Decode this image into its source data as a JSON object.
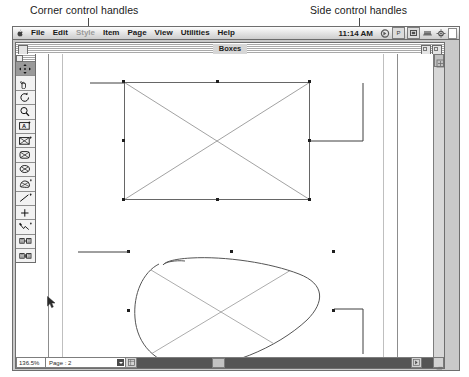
{
  "annotations": [
    {
      "id": "corner",
      "label": "Corner control handles"
    },
    {
      "id": "side",
      "label": "Side control handles"
    }
  ],
  "menubar": {
    "apple_icon": "apple-icon",
    "items": [
      {
        "label": "File",
        "enabled": true
      },
      {
        "label": "Edit",
        "enabled": true
      },
      {
        "label": "Style",
        "enabled": false
      },
      {
        "label": "Item",
        "enabled": true
      },
      {
        "label": "Page",
        "enabled": true
      },
      {
        "label": "View",
        "enabled": true
      },
      {
        "label": "Utilities",
        "enabled": true
      },
      {
        "label": "Help",
        "enabled": true
      }
    ],
    "clock": "11:14 AM",
    "status_icons": [
      {
        "name": "speaker-icon",
        "glyph": "◑"
      },
      {
        "name": "print-monitor-icon",
        "glyph": "P"
      },
      {
        "name": "network-icon",
        "glyph": "▣"
      },
      {
        "name": "filesharing-icon",
        "glyph": "▰"
      },
      {
        "name": "application-switcher-icon",
        "glyph": "✾"
      }
    ]
  },
  "window": {
    "title": "Boxes",
    "close_box": "close-box",
    "zoom_box": "zoom-box",
    "collapse_box": "collapse-box"
  },
  "tool_palette": {
    "title": "tool-palette-title",
    "tools": [
      {
        "name": "item-tool",
        "label": "Item tool",
        "active": true
      },
      {
        "name": "content-tool",
        "label": "Content tool",
        "active": false
      },
      {
        "name": "rotation-tool",
        "label": "Rotation tool",
        "active": false
      },
      {
        "name": "zoom-tool",
        "label": "Zoom tool",
        "active": false
      },
      {
        "name": "text-box-tool",
        "label": "Text box tool",
        "active": false
      },
      {
        "name": "rectangle-picture-box-tool",
        "label": "Rectangle picture box tool",
        "active": false
      },
      {
        "name": "rounded-picture-box-tool",
        "label": "Rounded-corner picture box tool",
        "active": false
      },
      {
        "name": "oval-picture-box-tool",
        "label": "Oval picture box tool",
        "active": false
      },
      {
        "name": "bezier-box-tool",
        "label": "Bezier picture box tool",
        "active": false
      },
      {
        "name": "line-tool",
        "label": "Line tool",
        "active": false
      },
      {
        "name": "orthogonal-line-tool",
        "label": "Orthogonal line tool",
        "active": false
      },
      {
        "name": "bezier-line-tool",
        "label": "Bezier line tool",
        "active": false
      },
      {
        "name": "linking-tool",
        "label": "Linking tool",
        "active": false
      },
      {
        "name": "unlinking-tool",
        "label": "Unlinking tool",
        "active": false
      }
    ]
  },
  "statusbar": {
    "zoom_value": "136.5%",
    "page_label": "Page : 2",
    "popup_icon": "page-popup-arrow-icon",
    "extra_icon": "page-thumbnail-icon"
  },
  "document": {
    "shapes": [
      {
        "name": "rectangle-picture-box",
        "type": "rectangle",
        "selected": true,
        "handles": 8,
        "empty_content_cross": true
      },
      {
        "name": "bezier-picture-box",
        "type": "freeform-bezier",
        "selected": true,
        "handles": 8,
        "empty_content_cross": true
      }
    ]
  },
  "scrollbars": {
    "vertical": "vertical-scrollbar",
    "horizontal": "horizontal-scrollbar",
    "resize_grip": "window-resize-grip"
  }
}
